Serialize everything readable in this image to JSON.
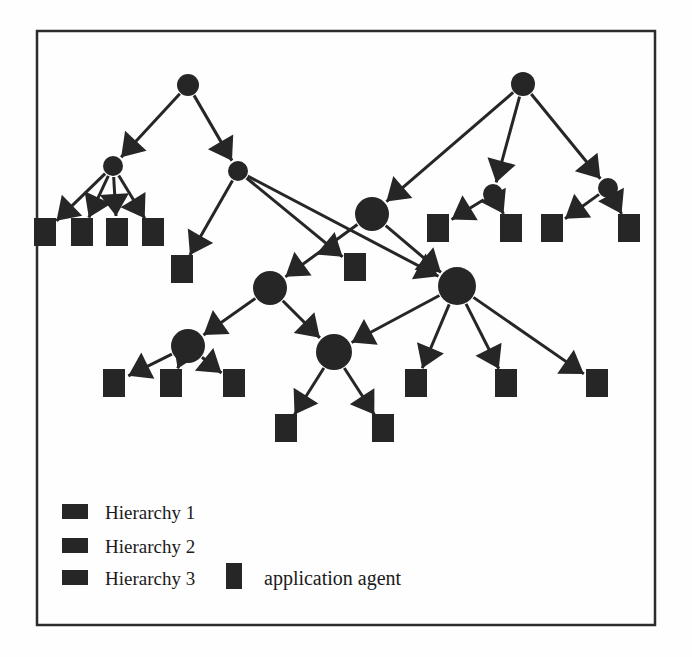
{
  "figure": {
    "kind": "diagram",
    "frame": {
      "x": 37,
      "y": 31,
      "width": 618,
      "height": 594,
      "stroke": "#2b2b2b",
      "stroke_width": 2.5
    },
    "ink_color": "#262626",
    "background": "#fefefe"
  },
  "legend": {
    "items": [
      {
        "label": "Hierarchy 1",
        "swatch": "legend-swatch-h1",
        "swatch_shape": "wide-rect",
        "color": "#262626"
      },
      {
        "label": "Hierarchy 2",
        "swatch": "legend-swatch-h2",
        "swatch_shape": "wide-rect",
        "color": "#262626"
      },
      {
        "label": "Hierarchy 3",
        "swatch": "legend-swatch-h3",
        "swatch_shape": "wide-rect",
        "color": "#262626"
      }
    ],
    "extra": {
      "label": "application agent",
      "swatch": "legend-swatch-agent",
      "swatch_shape": "tall-rect",
      "color": "#262626"
    }
  },
  "graph": {
    "node_styles": {
      "h1": {
        "shape": "circle",
        "r": 11,
        "note": "Hierarchy 1 root nodes"
      },
      "h2": {
        "shape": "circle",
        "r": 12,
        "note": "Hierarchy 2 nodes"
      },
      "h3": {
        "shape": "circle",
        "r": 18,
        "note": "Hierarchy 3 nodes"
      },
      "agent": {
        "shape": "rect",
        "width": 22,
        "height": 28,
        "note": "application agent leaves"
      }
    },
    "nodes": [
      {
        "id": "r1",
        "type": "h1",
        "x": 188,
        "y": 85,
        "r": 11
      },
      {
        "id": "r2",
        "type": "h1",
        "x": 523,
        "y": 84,
        "r": 12
      },
      {
        "id": "a1",
        "type": "h2",
        "x": 113,
        "y": 166,
        "r": 10
      },
      {
        "id": "a2",
        "type": "h2",
        "x": 238,
        "y": 171,
        "r": 10
      },
      {
        "id": "a3",
        "type": "h2",
        "x": 493,
        "y": 194,
        "r": 10
      },
      {
        "id": "a4",
        "type": "h2",
        "x": 608,
        "y": 188,
        "r": 10
      },
      {
        "id": "b1",
        "type": "h3",
        "x": 372,
        "y": 214,
        "r": 17
      },
      {
        "id": "b2",
        "type": "h3",
        "x": 270,
        "y": 288,
        "r": 17
      },
      {
        "id": "b3",
        "type": "h3",
        "x": 457,
        "y": 286,
        "r": 19
      },
      {
        "id": "b4",
        "type": "h3",
        "x": 188,
        "y": 346,
        "r": 17
      },
      {
        "id": "b5",
        "type": "h3",
        "x": 334,
        "y": 352,
        "r": 18
      },
      {
        "id": "s1",
        "type": "agent",
        "x": 45,
        "y": 232
      },
      {
        "id": "s2",
        "type": "agent",
        "x": 82,
        "y": 232
      },
      {
        "id": "s3",
        "type": "agent",
        "x": 117,
        "y": 232
      },
      {
        "id": "s4",
        "type": "agent",
        "x": 153,
        "y": 232
      },
      {
        "id": "s5",
        "type": "agent",
        "x": 182,
        "y": 269
      },
      {
        "id": "s6",
        "type": "agent",
        "x": 355,
        "y": 267
      },
      {
        "id": "s7",
        "type": "agent",
        "x": 438,
        "y": 228
      },
      {
        "id": "s8",
        "type": "agent",
        "x": 511,
        "y": 228
      },
      {
        "id": "s9",
        "type": "agent",
        "x": 552,
        "y": 228
      },
      {
        "id": "s10",
        "type": "agent",
        "x": 629,
        "y": 228
      },
      {
        "id": "s11",
        "type": "agent",
        "x": 114,
        "y": 383
      },
      {
        "id": "s12",
        "type": "agent",
        "x": 171,
        "y": 383
      },
      {
        "id": "s13",
        "type": "agent",
        "x": 234,
        "y": 383
      },
      {
        "id": "s14",
        "type": "agent",
        "x": 286,
        "y": 428
      },
      {
        "id": "s15",
        "type": "agent",
        "x": 383,
        "y": 428
      },
      {
        "id": "s16",
        "type": "agent",
        "x": 416,
        "y": 383
      },
      {
        "id": "s17",
        "type": "agent",
        "x": 506,
        "y": 383
      },
      {
        "id": "s18",
        "type": "agent",
        "x": 597,
        "y": 383
      }
    ],
    "edges": [
      {
        "from": "r1",
        "to": "a1"
      },
      {
        "from": "r1",
        "to": "a2"
      },
      {
        "from": "r2",
        "to": "b1"
      },
      {
        "from": "r2",
        "to": "a3"
      },
      {
        "from": "r2",
        "to": "a4"
      },
      {
        "from": "a1",
        "to": "s1"
      },
      {
        "from": "a1",
        "to": "s2"
      },
      {
        "from": "a1",
        "to": "s3"
      },
      {
        "from": "a1",
        "to": "s4"
      },
      {
        "from": "a2",
        "to": "s5"
      },
      {
        "from": "a2",
        "to": "s6"
      },
      {
        "from": "a2",
        "to": "b3"
      },
      {
        "from": "a3",
        "to": "s7"
      },
      {
        "from": "a3",
        "to": "s8"
      },
      {
        "from": "a4",
        "to": "s9"
      },
      {
        "from": "a4",
        "to": "s10"
      },
      {
        "from": "b1",
        "to": "b2"
      },
      {
        "from": "b1",
        "to": "b3"
      },
      {
        "from": "b2",
        "to": "b4"
      },
      {
        "from": "b2",
        "to": "b5"
      },
      {
        "from": "b3",
        "to": "b5"
      },
      {
        "from": "b3",
        "to": "s16"
      },
      {
        "from": "b3",
        "to": "s17"
      },
      {
        "from": "b3",
        "to": "s18"
      },
      {
        "from": "b4",
        "to": "s11"
      },
      {
        "from": "b4",
        "to": "s12"
      },
      {
        "from": "b4",
        "to": "s13"
      },
      {
        "from": "b5",
        "to": "s14"
      },
      {
        "from": "b5",
        "to": "s15"
      }
    ]
  }
}
